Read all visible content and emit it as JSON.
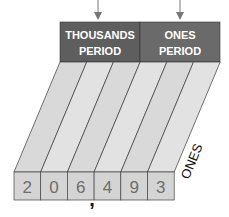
{
  "periods": [
    {
      "line1": "THOUSANDS",
      "line2": "PERIOD"
    },
    {
      "line1": "ONES",
      "line2": "PERIOD"
    }
  ],
  "places": [
    "HUNDREDS",
    "TENS",
    "ONES",
    "HUNDREDS",
    "TENS",
    "ONES"
  ],
  "digits": [
    "2",
    "0",
    "6",
    "4",
    "9",
    "3"
  ],
  "separator": ",",
  "colors": {
    "header": "#636363",
    "header_text": "#ffffff",
    "column": "#dedede",
    "box": "#d6d6d6",
    "digit": "#707070",
    "line": "#3a3a3a"
  }
}
